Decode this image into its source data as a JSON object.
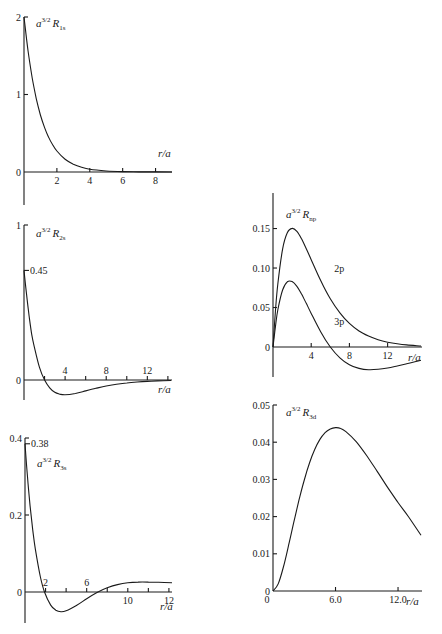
{
  "chart_data": [
    {
      "id": "r1s",
      "type": "line",
      "title": "a^{3/2} R_{1s}",
      "label_base": "a",
      "label_sup": "3/2",
      "label_R": "R",
      "label_sub": "1s",
      "xlabel": "r/a",
      "xlim": [
        0,
        9
      ],
      "ylim": [
        -0.45,
        2
      ],
      "xticks": [
        {
          "v": 2,
          "label": "2"
        },
        {
          "v": 4,
          "label": "4"
        },
        {
          "v": 6,
          "label": "6"
        },
        {
          "v": 8,
          "label": "8"
        }
      ],
      "yticks": [
        {
          "v": 2,
          "label": "2"
        },
        {
          "v": 1,
          "label": "1"
        },
        {
          "v": 0,
          "label": "0"
        }
      ],
      "annotations": [],
      "series": [
        {
          "name": "1s",
          "x": [
            0,
            0.25,
            0.5,
            0.75,
            1,
            1.25,
            1.5,
            1.75,
            2,
            2.5,
            3,
            3.5,
            4,
            5,
            6,
            7,
            8,
            9
          ],
          "y": [
            2,
            1.558,
            1.213,
            0.945,
            0.736,
            0.573,
            0.446,
            0.348,
            0.271,
            0.164,
            0.0996,
            0.0604,
            0.0366,
            0.0135,
            0.005,
            0.0018,
            0.0007,
            0.0002
          ]
        }
      ]
    },
    {
      "id": "r2s",
      "type": "line",
      "title": "a^{3/2} R_{2s}",
      "label_base": "a",
      "label_sup": "3/2",
      "label_R": "R",
      "label_sub": "2s",
      "xlabel": "r/a",
      "xlim": [
        0,
        14.4
      ],
      "ylim": [
        -0.15,
        1
      ],
      "xticks": [
        {
          "v": 2,
          "label": ""
        },
        {
          "v": 4,
          "label": "4"
        },
        {
          "v": 6,
          "label": ""
        },
        {
          "v": 8,
          "label": "8"
        },
        {
          "v": 10,
          "label": ""
        },
        {
          "v": 12,
          "label": "12"
        },
        {
          "v": 14,
          "label": ""
        }
      ],
      "yticks": [
        {
          "v": 1,
          "label": "1"
        },
        {
          "v": 0,
          "label": "0"
        }
      ],
      "annotations": [
        {
          "y": 0.707,
          "label": "0.45"
        }
      ],
      "series": [
        {
          "name": "2s",
          "x": [
            0,
            0.25,
            0.5,
            0.75,
            1,
            1.5,
            2,
            2.5,
            3,
            3.5,
            4,
            5,
            6,
            7,
            8,
            9,
            10,
            11,
            12,
            13,
            14.3
          ],
          "y": [
            0.707,
            0.551,
            0.413,
            0.294,
            0.214,
            0.083,
            0,
            -0.0505,
            -0.0789,
            -0.0913,
            -0.0957,
            -0.087,
            -0.0704,
            -0.0534,
            -0.0389,
            -0.0276,
            -0.0191,
            -0.013,
            -0.0088,
            -0.0059,
            -0.0034
          ]
        }
      ]
    },
    {
      "id": "r3s",
      "type": "line",
      "title": "a^{3/2} R_{3s}",
      "label_base": "a",
      "label_sup": "3/2",
      "label_R": "R",
      "label_sub": "3s",
      "xlabel": "r/a",
      "xlim": [
        0,
        14.3
      ],
      "ylim": [
        -0.08,
        0.4
      ],
      "xticks": [
        {
          "v": 2,
          "label": "2"
        },
        {
          "v": 4,
          "label": ""
        },
        {
          "v": 6,
          "label": "6"
        },
        {
          "v": 8,
          "label": ""
        },
        {
          "v": 10,
          "label": "10"
        },
        {
          "v": 12,
          "label": ""
        },
        {
          "v": 14,
          "label": "12"
        }
      ],
      "yticks": [
        {
          "v": 0.4,
          "label": "0.4"
        },
        {
          "v": 0.2,
          "label": "0.2"
        },
        {
          "v": 0,
          "label": "0"
        }
      ],
      "annotations": [
        {
          "y": 0.385,
          "label": "0.38"
        }
      ],
      "series": [
        {
          "name": "3s",
          "x": [
            0,
            0.25,
            0.5,
            0.75,
            1,
            1.5,
            1.9,
            2.5,
            3,
            3.5,
            4,
            5,
            6,
            7,
            8,
            9,
            10,
            11,
            12,
            13,
            14.3
          ],
          "y": [
            0.385,
            0.296,
            0.2231,
            0.162,
            0.1123,
            0.0389,
            0,
            -0.0341,
            -0.0472,
            -0.0511,
            -0.0488,
            -0.035,
            -0.0174,
            -0.0014,
            0.0109,
            0.0192,
            0.0239,
            0.0258,
            0.0258,
            0.0252,
            0.0242
          ]
        }
      ]
    },
    {
      "id": "rnp",
      "type": "line",
      "title": "a^{3/2} R_{np}",
      "label_base": "a",
      "label_sup": "3/2",
      "label_R": "R",
      "label_sub": "np",
      "xlabel": "r/a",
      "xlim": [
        0,
        15.6
      ],
      "ylim": [
        -0.038,
        0.195
      ],
      "xticks": [
        {
          "v": 4,
          "label": "4"
        },
        {
          "v": 8,
          "label": "8"
        },
        {
          "v": 12,
          "label": "12"
        }
      ],
      "yticks": [
        {
          "v": 0.15,
          "label": "0.15"
        },
        {
          "v": 0.1,
          "label": "0.10"
        },
        {
          "v": 0.05,
          "label": "0.05"
        },
        {
          "v": 0,
          "label": "0"
        }
      ],
      "annotations": [],
      "series": [
        {
          "name": "2p",
          "label": "2p",
          "label_at": {
            "x": 6.4,
            "y": 0.095
          },
          "x": [
            0,
            0.25,
            0.5,
            1,
            1.5,
            2,
            2.5,
            3,
            3.5,
            4,
            5,
            6,
            7,
            8,
            9,
            10,
            11,
            12,
            13,
            14,
            15.5
          ],
          "y": [
            0,
            0.045,
            0.0795,
            0.1238,
            0.1446,
            0.1502,
            0.1464,
            0.1366,
            0.124,
            0.1105,
            0.0838,
            0.061,
            0.0432,
            0.0299,
            0.0203,
            0.0138,
            0.0092,
            0.0061,
            0.004,
            0.0026,
            0.0013
          ]
        },
        {
          "name": "3p",
          "label": "3p",
          "label_at": {
            "x": 6.4,
            "y": 0.028
          },
          "x": [
            0,
            0.25,
            0.5,
            1,
            1.5,
            2,
            2.5,
            3,
            3.5,
            4,
            5,
            6,
            7,
            8,
            9,
            10,
            11,
            12,
            13,
            14,
            15.5
          ],
          "y": [
            0,
            0.0255,
            0.0469,
            0.0722,
            0.0825,
            0.0828,
            0.0767,
            0.0667,
            0.0549,
            0.0425,
            0.019,
            0,
            -0.0137,
            -0.0224,
            -0.0271,
            -0.0288,
            -0.0283,
            -0.0266,
            -0.0241,
            -0.0212,
            -0.0169
          ]
        }
      ]
    },
    {
      "id": "r3d",
      "type": "line",
      "title": "a^{3/2} R_{3d}",
      "label_base": "a",
      "label_sup": "3/2",
      "label_R": "R",
      "label_sub": "3d",
      "xlabel": "r/a",
      "xlim": [
        0,
        14.3
      ],
      "ylim": [
        0,
        0.05
      ],
      "xticks": [
        {
          "v": 6,
          "label": "6.0"
        },
        {
          "v": 12,
          "label": "12.0"
        }
      ],
      "yticks": [
        {
          "v": 0.05,
          "label": "0.05"
        },
        {
          "v": 0.04,
          "label": "0.04"
        },
        {
          "v": 0.03,
          "label": "0.03"
        },
        {
          "v": 0.02,
          "label": "0.02"
        },
        {
          "v": 0.01,
          "label": "0.01"
        },
        {
          "v": 0,
          "label": "0"
        }
      ],
      "annotations": [],
      "series": [
        {
          "name": "3d",
          "x": [
            0,
            0.5,
            1,
            1.5,
            2,
            2.5,
            3,
            3.5,
            4,
            4.5,
            5,
            5.5,
            6,
            6.5,
            7,
            8,
            9,
            10,
            11,
            12,
            13,
            14.2
          ],
          "y": [
            0,
            0.00191,
            0.00646,
            0.01231,
            0.01852,
            0.02449,
            0.02985,
            0.03441,
            0.03803,
            0.04075,
            0.04257,
            0.04357,
            0.04393,
            0.04372,
            0.04285,
            0.0401,
            0.03636,
            0.03216,
            0.02786,
            0.02378,
            0.01996,
            0.015
          ]
        }
      ]
    }
  ]
}
